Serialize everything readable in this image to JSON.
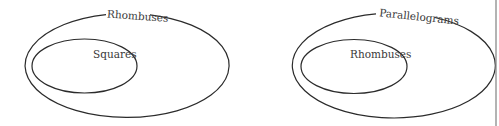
{
  "diagrams": [
    {
      "outer_label": "Rhombuses",
      "inner_label": "Squares"
    },
    {
      "outer_label": "Parallelograms",
      "inner_label": "Rhombuses"
    }
  ],
  "colors": {
    "stroke": "#2b2b2b",
    "text": "#3a3a3a",
    "right_edge_line": "#8a8a8a",
    "background": "#ffffff"
  }
}
